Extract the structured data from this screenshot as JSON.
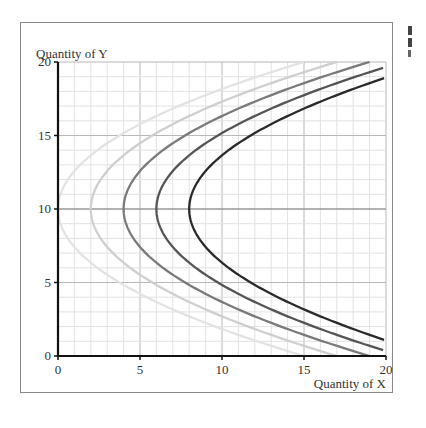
{
  "chart_data": {
    "type": "line",
    "title": "",
    "xlabel": "Quantity of X",
    "ylabel": "Quantity of Y",
    "xlim": [
      0,
      20
    ],
    "ylim": [
      0,
      20
    ],
    "x_ticks": [
      "0",
      "5",
      "10",
      "15",
      "20"
    ],
    "y_ticks": [
      "0",
      "5",
      "10",
      "15",
      "20"
    ],
    "grid": true,
    "minor_grid_step": 1,
    "major_grid_step": 5,
    "legend": null,
    "series": [
      {
        "name": "curve-1",
        "vertex_x": 0,
        "color": "#e3e3e3",
        "points": [
          [
            15,
            0
          ],
          [
            9.6,
            2
          ],
          [
            5.4,
            4
          ],
          [
            2.4,
            6
          ],
          [
            0.6,
            8
          ],
          [
            0,
            10
          ],
          [
            0.6,
            12
          ],
          [
            2.4,
            14
          ],
          [
            5.4,
            16
          ],
          [
            9.6,
            18
          ],
          [
            15,
            20
          ]
        ]
      },
      {
        "name": "curve-2",
        "vertex_x": 2,
        "color": "#cfcfcf",
        "points": [
          [
            17,
            0
          ],
          [
            11.6,
            2
          ],
          [
            7.4,
            4
          ],
          [
            4.4,
            6
          ],
          [
            2.6,
            8
          ],
          [
            2,
            10
          ],
          [
            2.6,
            12
          ],
          [
            4.4,
            14
          ],
          [
            7.4,
            16
          ],
          [
            11.6,
            18
          ],
          [
            17,
            20
          ]
        ]
      },
      {
        "name": "curve-3",
        "vertex_x": 4,
        "color": "#7a7a7a",
        "points": [
          [
            19,
            0
          ],
          [
            13.6,
            2
          ],
          [
            9.4,
            4
          ],
          [
            6.4,
            6
          ],
          [
            4.6,
            8
          ],
          [
            4,
            10
          ],
          [
            4.6,
            12
          ],
          [
            6.4,
            14
          ],
          [
            9.4,
            16
          ],
          [
            13.6,
            18
          ],
          [
            19,
            20
          ]
        ]
      },
      {
        "name": "curve-4",
        "vertex_x": 6,
        "color": "#555555",
        "points": [
          [
            20,
            0.35
          ],
          [
            15.6,
            2
          ],
          [
            11.4,
            4
          ],
          [
            8.4,
            6
          ],
          [
            6.6,
            8
          ],
          [
            6,
            10
          ],
          [
            6.6,
            12
          ],
          [
            8.4,
            14
          ],
          [
            11.4,
            16
          ],
          [
            15.6,
            18
          ],
          [
            20,
            19.65
          ]
        ]
      },
      {
        "name": "curve-5",
        "vertex_x": 8,
        "color": "#2a2a2a",
        "points": [
          [
            20,
            1.06
          ],
          [
            17.6,
            2
          ],
          [
            13.4,
            4
          ],
          [
            10.4,
            6
          ],
          [
            8.6,
            8
          ],
          [
            8,
            10
          ],
          [
            8.6,
            12
          ],
          [
            10.4,
            14
          ],
          [
            13.4,
            16
          ],
          [
            17.6,
            18
          ],
          [
            20,
            18.94
          ]
        ]
      }
    ]
  }
}
